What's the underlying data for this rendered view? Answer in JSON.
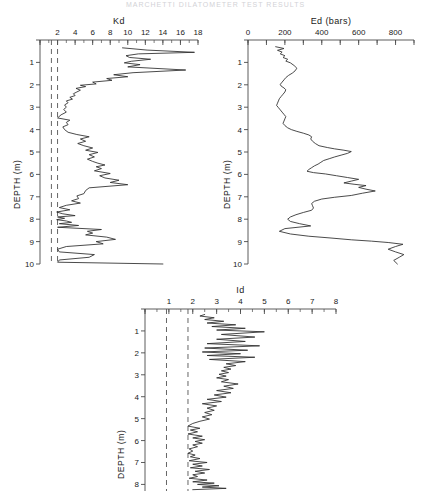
{
  "figure": {
    "top_note": "MARCHETTI DILATOMETER TEST RESULTS",
    "depth_axis_label": "DEPTH (m)",
    "line_color": "#2b2b2b",
    "axis_color": "#4a4a4a",
    "dashed_color": "#555555",
    "background": "#ffffff"
  },
  "chart_data": [
    {
      "type": "line",
      "name": "kd-profile",
      "title": "Kd",
      "xlabel": "Kd",
      "ylabel": "DEPTH (m)",
      "xlim": [
        0,
        18
      ],
      "ylim": [
        0,
        10
      ],
      "xticks": [
        0,
        2,
        4,
        6,
        8,
        10,
        12,
        14,
        16,
        18
      ],
      "xtick_labels": [
        "",
        "2",
        "4",
        "6",
        "8",
        "10",
        "12",
        "14",
        "16",
        "18"
      ],
      "xminor_step": 1,
      "yticks": [
        0,
        1,
        2,
        3,
        4,
        5,
        6,
        7,
        8,
        9,
        10
      ],
      "ytick_labels": [
        "",
        "1",
        "2",
        "3",
        "4",
        "5",
        "6",
        "7",
        "8",
        "9",
        "10"
      ],
      "grid": false,
      "legend": "none",
      "reference_lines": [
        {
          "orientation": "vertical",
          "value": 1.3,
          "style": "dashed"
        },
        {
          "orientation": "vertical",
          "value": 2.0,
          "style": "dashed"
        }
      ],
      "x": [
        9.4,
        12.2,
        17.6,
        11.2,
        9.8,
        10.2,
        12.6,
        10.4,
        9.6,
        11.4,
        10.0,
        16.6,
        10.6,
        8.4,
        10.0,
        7.6,
        8.2,
        6.0,
        6.4,
        4.6,
        5.2,
        4.1,
        4.6,
        4.2,
        3.8,
        4.0,
        3.4,
        3.7,
        3.0,
        3.2,
        2.8,
        3.0,
        2.7,
        3.0,
        2.4,
        2.0,
        3.4,
        3.0,
        3.2,
        2.6,
        2.8,
        3.2,
        4.2,
        5.6,
        4.6,
        5.2,
        4.3,
        5.0,
        6.0,
        5.2,
        6.6,
        5.6,
        6.2,
        5.4,
        6.0,
        6.6,
        7.4,
        6.4,
        7.0,
        6.2,
        8.0,
        6.8,
        7.4,
        9.0,
        8.0,
        10.0,
        5.6,
        5.2,
        5.0,
        4.2,
        4.4,
        3.6,
        4.6,
        3.0,
        2.2,
        3.4,
        1.9,
        2.6,
        4.0,
        2.0,
        2.8,
        1.9,
        3.0,
        3.6,
        2.2,
        4.4,
        2.0,
        7.0,
        5.4,
        6.0,
        5.2,
        7.6,
        8.6,
        6.4,
        7.2,
        3.0,
        2.0,
        2.2,
        6.2,
        5.6,
        2.2,
        2.0,
        14.0
      ],
      "y": [
        0.35,
        0.45,
        0.55,
        0.62,
        0.7,
        0.78,
        0.86,
        0.95,
        1.02,
        1.1,
        1.2,
        1.34,
        1.46,
        1.55,
        1.64,
        1.72,
        1.8,
        1.88,
        1.96,
        2.02,
        2.08,
        2.16,
        2.24,
        2.32,
        2.4,
        2.48,
        2.56,
        2.64,
        2.72,
        2.8,
        2.9,
        3.0,
        3.1,
        3.22,
        3.34,
        3.48,
        3.58,
        3.68,
        3.78,
        3.88,
        4.0,
        4.12,
        4.22,
        4.32,
        4.42,
        4.52,
        4.62,
        4.72,
        4.82,
        4.92,
        5.02,
        5.12,
        5.22,
        5.32,
        5.42,
        5.5,
        5.58,
        5.66,
        5.74,
        5.84,
        5.96,
        6.06,
        6.16,
        6.26,
        6.36,
        6.46,
        6.6,
        6.72,
        6.86,
        6.96,
        7.08,
        7.18,
        7.28,
        7.38,
        7.48,
        7.58,
        7.68,
        7.76,
        7.84,
        7.9,
        7.96,
        8.02,
        8.08,
        8.14,
        8.2,
        8.28,
        8.36,
        8.46,
        8.54,
        8.62,
        8.7,
        8.8,
        8.9,
        9.0,
        9.1,
        9.22,
        9.34,
        9.46,
        9.58,
        9.7,
        9.82,
        9.92,
        10.0
      ]
    },
    {
      "type": "line",
      "name": "ed-profile",
      "title": "Ed (bars)",
      "xlabel": "Ed (bars)",
      "ylabel": "DEPTH (m)",
      "xlim": [
        0,
        900
      ],
      "ylim": [
        0,
        10
      ],
      "xticks": [
        0,
        100,
        200,
        300,
        400,
        500,
        600,
        700,
        800,
        900
      ],
      "xtick_labels": [
        "0",
        "",
        "200",
        "",
        "400",
        "",
        "600",
        "",
        "800",
        ""
      ],
      "xminor_step": 100,
      "yticks": [
        0,
        1,
        2,
        3,
        4,
        5,
        6,
        7,
        8,
        9,
        10
      ],
      "ytick_labels": [
        "",
        "1",
        "2",
        "3",
        "4",
        "5",
        "6",
        "7",
        "8",
        "9",
        "10"
      ],
      "grid": false,
      "legend": "none",
      "reference_lines": [],
      "x": [
        150,
        195,
        160,
        185,
        175,
        200,
        190,
        215,
        205,
        230,
        250,
        265,
        255,
        240,
        220,
        205,
        195,
        185,
        175,
        180,
        195,
        205,
        200,
        190,
        180,
        170,
        165,
        160,
        155,
        165,
        175,
        185,
        195,
        205,
        200,
        195,
        190,
        200,
        215,
        235,
        265,
        300,
        330,
        345,
        340,
        350,
        365,
        385,
        430,
        470,
        520,
        560,
        540,
        505,
        470,
        440,
        410,
        395,
        380,
        360,
        345,
        330,
        320,
        355,
        420,
        480,
        540,
        600,
        560,
        520,
        575,
        640,
        600,
        640,
        690,
        620,
        560,
        470,
        400,
        360,
        345,
        350,
        355,
        345,
        300,
        260,
        230,
        215,
        230,
        280,
        340,
        200,
        170,
        230,
        330,
        450,
        560,
        670,
        760,
        840,
        800,
        760,
        800,
        845,
        820,
        790,
        810
      ],
      "y": [
        0.3,
        0.38,
        0.46,
        0.54,
        0.62,
        0.7,
        0.78,
        0.86,
        0.94,
        1.02,
        1.14,
        1.26,
        1.38,
        1.48,
        1.58,
        1.68,
        1.78,
        1.88,
        1.98,
        2.06,
        2.14,
        2.22,
        2.32,
        2.42,
        2.52,
        2.62,
        2.72,
        2.82,
        2.92,
        3.02,
        3.12,
        3.22,
        3.32,
        3.42,
        3.52,
        3.62,
        3.72,
        3.82,
        3.92,
        4.0,
        4.08,
        4.16,
        4.24,
        4.32,
        4.42,
        4.52,
        4.62,
        4.72,
        4.8,
        4.86,
        4.92,
        4.98,
        5.06,
        5.14,
        5.22,
        5.3,
        5.38,
        5.46,
        5.54,
        5.62,
        5.7,
        5.78,
        5.86,
        5.92,
        5.98,
        6.06,
        6.14,
        6.22,
        6.3,
        6.38,
        6.44,
        6.5,
        6.58,
        6.66,
        6.74,
        6.84,
        6.94,
        7.02,
        7.1,
        7.2,
        7.3,
        7.4,
        7.5,
        7.6,
        7.7,
        7.8,
        7.9,
        8.0,
        8.1,
        8.2,
        8.3,
        8.42,
        8.54,
        8.66,
        8.76,
        8.84,
        8.92,
        8.98,
        9.04,
        9.12,
        9.22,
        9.34,
        9.46,
        9.58,
        9.7,
        9.84,
        10.0
      ]
    },
    {
      "type": "line",
      "name": "id-profile",
      "title": "Id",
      "xlabel": "Id",
      "ylabel": "DEPTH (m)",
      "xlim": [
        0,
        8
      ],
      "ylim": [
        0,
        8.3
      ],
      "xticks": [
        0,
        1,
        2,
        3,
        4,
        5,
        6,
        7,
        8
      ],
      "xtick_labels": [
        "",
        "1",
        "2",
        "3",
        "4",
        "5",
        "6",
        "7",
        "8"
      ],
      "xminor_step": 0.5,
      "yticks": [
        0,
        1,
        2,
        3,
        4,
        5,
        6,
        7,
        8
      ],
      "ytick_labels": [
        "",
        "1",
        "2",
        "3",
        "4",
        "5",
        "6",
        "7",
        "8"
      ],
      "grid": false,
      "legend": "none",
      "reference_lines": [
        {
          "orientation": "vertical",
          "value": 0.9,
          "style": "dashed"
        },
        {
          "orientation": "vertical",
          "value": 1.8,
          "style": "dashed"
        }
      ],
      "x": [
        2.5,
        2.3,
        2.9,
        2.5,
        3.3,
        2.6,
        3.8,
        2.8,
        4.2,
        3.0,
        5.0,
        3.2,
        4.6,
        3.0,
        4.2,
        2.6,
        4.8,
        2.5,
        4.3,
        2.4,
        4.0,
        2.6,
        4.6,
        2.7,
        4.2,
        3.4,
        3.8,
        3.3,
        3.6,
        3.2,
        3.5,
        3.1,
        3.4,
        3.0,
        3.5,
        3.2,
        3.9,
        3.3,
        3.7,
        3.0,
        3.6,
        2.9,
        3.4,
        2.6,
        3.2,
        2.4,
        3.0,
        2.6,
        2.9,
        2.5,
        2.8,
        2.4,
        2.7,
        2.3,
        2.0,
        1.8,
        2.3,
        1.9,
        2.2,
        1.8,
        2.4,
        2.0,
        2.5,
        2.1,
        2.4,
        2.0,
        2.2,
        1.85,
        2.0,
        1.8,
        2.1,
        1.9,
        2.3,
        1.85,
        2.6,
        2.0,
        2.4,
        1.9,
        2.7,
        2.1,
        2.5,
        2.0,
        2.2,
        1.85,
        2.6,
        2.0,
        2.9,
        2.2,
        3.1,
        2.4,
        3.4,
        2.0,
        1.85,
        4.2
      ],
      "y": [
        0.25,
        0.32,
        0.4,
        0.48,
        0.56,
        0.64,
        0.72,
        0.8,
        0.88,
        0.96,
        1.04,
        1.16,
        1.28,
        1.38,
        1.48,
        1.58,
        1.68,
        1.78,
        1.88,
        1.96,
        2.04,
        2.12,
        2.2,
        2.3,
        2.4,
        2.5,
        2.58,
        2.66,
        2.74,
        2.82,
        2.9,
        2.98,
        3.06,
        3.14,
        3.22,
        3.32,
        3.42,
        3.52,
        3.62,
        3.72,
        3.82,
        3.92,
        4.02,
        4.12,
        4.22,
        4.32,
        4.42,
        4.52,
        4.62,
        4.72,
        4.82,
        4.92,
        5.02,
        5.12,
        5.22,
        5.34,
        5.44,
        5.52,
        5.6,
        5.7,
        5.8,
        5.88,
        5.96,
        6.04,
        6.12,
        6.2,
        6.28,
        6.38,
        6.48,
        6.58,
        6.66,
        6.74,
        6.82,
        6.92,
        7.0,
        7.08,
        7.16,
        7.24,
        7.32,
        7.4,
        7.48,
        7.56,
        7.64,
        7.72,
        7.8,
        7.88,
        7.94,
        8.0,
        8.06,
        8.12,
        8.18,
        8.24
      ]
    }
  ]
}
